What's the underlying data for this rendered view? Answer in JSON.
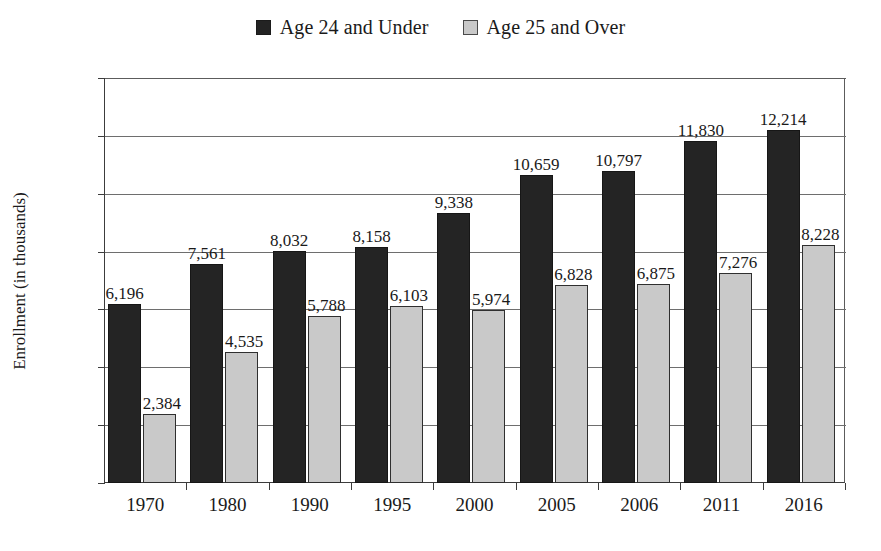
{
  "chart_data": {
    "type": "bar",
    "title": "",
    "xlabel": "",
    "ylabel": "Enrollment (in thousands)",
    "categories": [
      "1970",
      "1980",
      "1990",
      "1995",
      "2000",
      "2005",
      "2006",
      "2011",
      "2016"
    ],
    "series": [
      {
        "name": "Age 24 and Under",
        "color": "#242424",
        "values": [
          6196,
          7561,
          8032,
          8158,
          9338,
          10659,
          10797,
          11830,
          12214
        ],
        "labels": [
          "6,196",
          "7,561",
          "8,032",
          "8,158",
          "9,338",
          "10,659",
          "10,797",
          "11,830",
          "12,214"
        ]
      },
      {
        "name": "Age 25 and Over",
        "color": "#c9c9c9",
        "values": [
          2384,
          4535,
          5788,
          6103,
          5974,
          6828,
          6875,
          7276,
          8228
        ],
        "labels": [
          "2,384",
          "4,535",
          "5,788",
          "6,103",
          "5,974",
          "6,828",
          "6,875",
          "7,276",
          "8,228"
        ]
      }
    ],
    "ylim": [
      0,
      14000
    ],
    "yticks": [
      0,
      2000,
      4000,
      6000,
      8000,
      10000,
      12000,
      14000
    ],
    "ytick_labels": [
      "0",
      "2,000",
      "4,000",
      "6,000",
      "8,000",
      "10,000",
      "12,000",
      "14,000"
    ],
    "grid": true,
    "legend_position": "top-center"
  },
  "legend": {
    "entries": [
      {
        "label": "Age 24 and Under",
        "swatch": "dark-square-icon"
      },
      {
        "label": "Age 25 and Over",
        "swatch": "light-square-icon"
      }
    ]
  },
  "caption": ""
}
